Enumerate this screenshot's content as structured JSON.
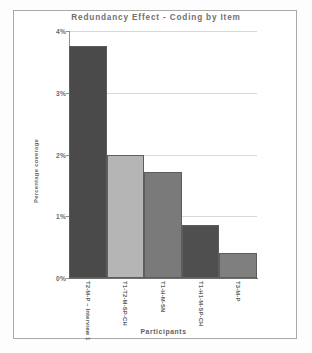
{
  "figure": {
    "border_color": "#a9a9a9",
    "background": "#ffffff"
  },
  "axis_titles": {
    "x": "Participants",
    "y": "Percentage coverage"
  },
  "chart_data": {
    "type": "bar",
    "title": "Redundancy Effect - Coding by Item",
    "xlabel": "Participants",
    "ylabel": "Percentage coverage",
    "ylim": [
      0,
      4
    ],
    "ytick_labels": [
      "0%",
      "1%",
      "2%",
      "3%",
      "4%"
    ],
    "ytick_values": [
      0,
      1,
      2,
      3,
      4
    ],
    "grid": true,
    "grid_axis": "y",
    "legend": false,
    "categories": [
      "T2-M-P – Interview 1",
      "T1-T2-M-SP-CH",
      "T1-H-M-SN",
      "T1-H1-M-SP-CH",
      "T3-M-P"
    ],
    "values": [
      3.75,
      2.0,
      1.72,
      0.86,
      0.4
    ],
    "value_labels": [
      "3.75%",
      "2.00%",
      "1.72%",
      "0.86%",
      "0.40%"
    ],
    "bar_colors": [
      "#4a4a4a",
      "#b5b5b5",
      "#7a7a7a",
      "#4f4f4f",
      "#7f7f7f"
    ],
    "bar_edge_color": "#5d5d5d"
  }
}
